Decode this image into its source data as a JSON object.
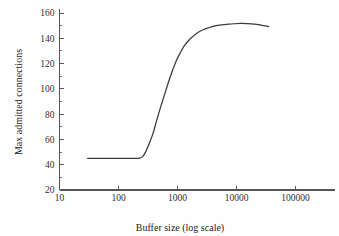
{
  "chart_data": {
    "type": "line",
    "title": "",
    "xlabel": "Buffer size (log scale)",
    "ylabel": "Max admitted connections",
    "x_scale": "log",
    "y_scale": "linear",
    "xlim": [
      10,
      300000
    ],
    "ylim": [
      20,
      165
    ],
    "grid": false,
    "legend": null,
    "x_tick_labels": [
      "10",
      "100",
      "1000",
      "10000",
      "100000"
    ],
    "x_tick_values": [
      10,
      100,
      1000,
      10000,
      100000
    ],
    "y_tick_labels": [
      "20",
      "40",
      "60",
      "80",
      "100",
      "120",
      "140",
      "160"
    ],
    "y_tick_values": [
      20,
      40,
      60,
      80,
      100,
      120,
      140,
      160
    ],
    "y_minor_tick_values": [
      30,
      50,
      70,
      90,
      110,
      130,
      150
    ],
    "series": [
      {
        "name": "Max admitted connections",
        "color": "#3a3a3a",
        "x": [
          30,
          50,
          80,
          120,
          160,
          200,
          220,
          250,
          280,
          320,
          380,
          450,
          520,
          600,
          700,
          800,
          950,
          1100,
          1300,
          1600,
          2000,
          2500,
          3200,
          4000,
          5200,
          6800,
          9000,
          12000,
          15000,
          20000,
          26000,
          35000
        ],
        "y": [
          45,
          45,
          45,
          45,
          45,
          45,
          45,
          46,
          49,
          55,
          64,
          76,
          86,
          95,
          105,
          113,
          122,
          128,
          134,
          139,
          143,
          146,
          148,
          149.5,
          150.5,
          151,
          151.5,
          151.7,
          151.6,
          151.2,
          150.4,
          149.3
        ]
      }
    ]
  },
  "axes": {
    "x_axis_name": "buffer-size-axis",
    "y_axis_name": "max-connections-axis"
  }
}
